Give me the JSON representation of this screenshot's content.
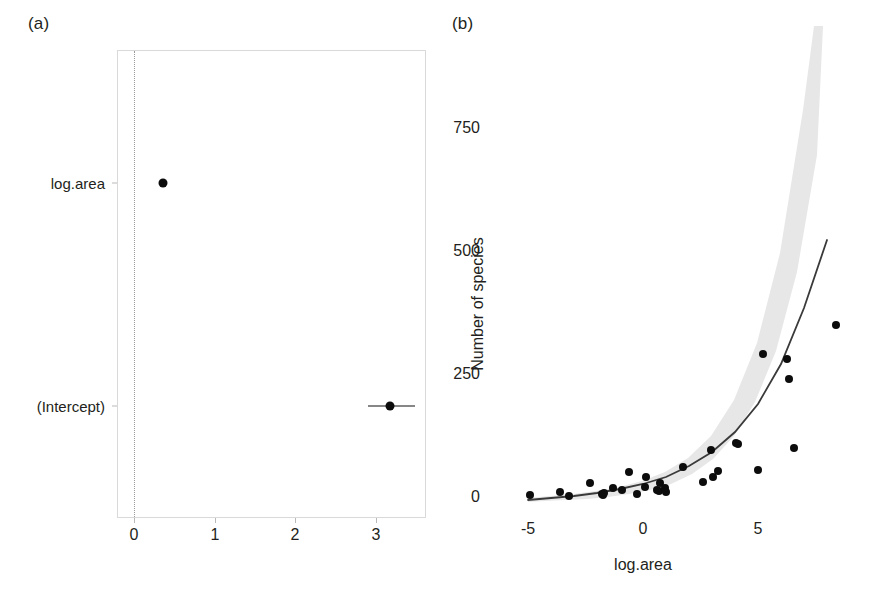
{
  "figure": {
    "panel_a_label": "(a)",
    "panel_b_label": "(b)"
  },
  "chart_data": [
    {
      "type": "scatter",
      "panel": "(a)",
      "title": "",
      "subtitle": "",
      "xlabel": "",
      "ylabel": "",
      "orientation": "horizontal",
      "grid": false,
      "reference_line": {
        "value": 0,
        "style": "dotted"
      },
      "xlim": [
        -0.2,
        3.63
      ],
      "xticks": [
        0,
        1,
        2,
        3
      ],
      "xticklabels": [
        "0",
        "1",
        "2",
        "3"
      ],
      "categories": [
        "(Intercept)",
        "log.area"
      ],
      "yticklabels": [
        "(Intercept)",
        "log.area"
      ],
      "points": [
        {
          "term": "log.area",
          "estimate": 0.36,
          "conf_low": 0.34,
          "conf_high": 0.38
        },
        {
          "term": "(Intercept)",
          "estimate": 3.16,
          "conf_low": 2.88,
          "conf_high": 3.46
        }
      ],
      "series": [
        {
          "name": "estimate",
          "values": [
            3.16,
            0.36
          ]
        }
      ]
    },
    {
      "type": "scatter",
      "panel": "(b)",
      "title": "",
      "subtitle": "",
      "xlabel": "log.area",
      "ylabel": "Number of species",
      "grid": false,
      "xlim": [
        -5.6,
        9.6
      ],
      "ylim": [
        -30,
        880
      ],
      "xticks": [
        -5,
        0,
        5
      ],
      "xticklabels": [
        "-5",
        "0",
        "5"
      ],
      "yticks": [
        0,
        250,
        500,
        750
      ],
      "yticklabels": [
        "0",
        "250",
        "500",
        "750"
      ],
      "x": [
        -4.9,
        -3.6,
        -3.2,
        -2.3,
        -1.8,
        -1.75,
        -1.7,
        -1.3,
        -0.9,
        -0.6,
        -0.25,
        0.1,
        0.15,
        0.6,
        0.7,
        0.75,
        0.95,
        1.0,
        1.75,
        2.6,
        2.95,
        3.05,
        3.25,
        4.05,
        4.15,
        5.0,
        5.2,
        6.25,
        6.35,
        6.55,
        8.4
      ],
      "y": [
        5,
        10,
        2,
        28,
        6,
        5,
        8,
        18,
        14,
        50,
        6,
        20,
        40,
        15,
        12,
        28,
        18,
        10,
        62,
        30,
        95,
        40,
        52,
        110,
        108,
        55,
        290,
        280,
        240,
        100,
        350
      ],
      "fit_line": {
        "name": "fitted Poisson GLM",
        "x": [
          -5.0,
          -4.0,
          -3.0,
          -2.0,
          -1.0,
          0.0,
          1.0,
          2.0,
          3.0,
          4.0,
          5.0,
          6.0,
          7.0,
          8.0
        ],
        "y": [
          4,
          6,
          8,
          11,
          17,
          24,
          34,
          49,
          70,
          101,
          145,
          208,
          299,
          429
        ]
      },
      "confidence_band": {
        "level": "95%",
        "shade": "#e8e8e8"
      }
    }
  ]
}
